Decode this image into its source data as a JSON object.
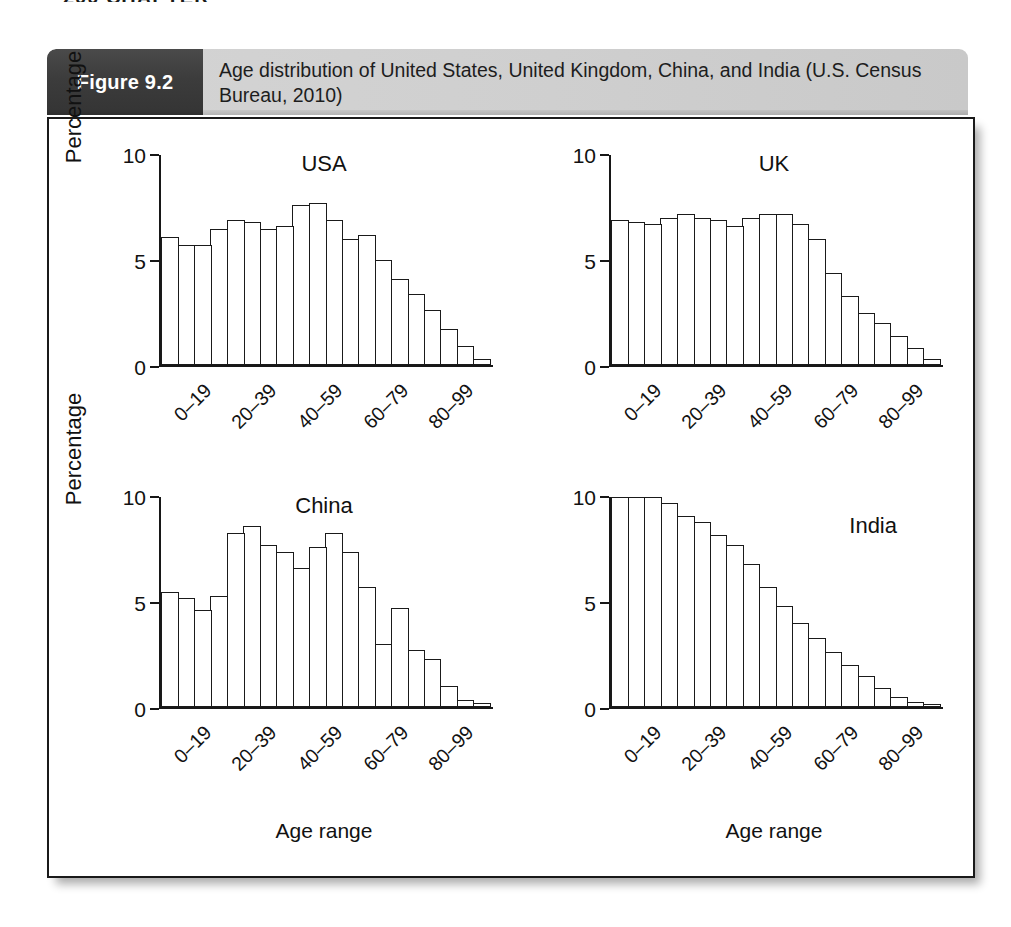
{
  "page": {
    "header_remnant": "200  CHAPTER"
  },
  "figure": {
    "number_label": "Figure 9.2",
    "caption": "Age distribution of United States, United Kingdom, China, and India (U.S. Census Bureau, 2010)"
  },
  "axes": {
    "ylabel": "Percentage",
    "xlabel": "Age range",
    "y_ticks": [
      "0",
      "5",
      "10"
    ],
    "x_tick_labels": [
      "0–19",
      "20–39",
      "40–59",
      "60–79",
      "80–99"
    ]
  },
  "colors": {
    "banner_dark": "#3c3c3c",
    "banner_light": "#cfcfcf",
    "ink": "#1a1a1a",
    "panel_background": "#ffffff"
  },
  "chart_data": [
    {
      "type": "bar",
      "title": "USA",
      "xlabel": "Age range",
      "ylabel": "Percentage",
      "ylim": [
        0,
        10
      ],
      "yticks": [
        0,
        5,
        10
      ],
      "grid": false,
      "legend": "none",
      "bin_width_years": 5,
      "categories": [
        "0–4",
        "5–9",
        "10–14",
        "15–19",
        "20–24",
        "25–29",
        "30–34",
        "35–39",
        "40–44",
        "45–49",
        "50–54",
        "55–59",
        "60–64",
        "65–69",
        "70–74",
        "75–79",
        "80–84",
        "85–89",
        "90–94",
        "95–99"
      ],
      "values": [
        6.1,
        5.7,
        5.7,
        6.5,
        6.9,
        6.8,
        6.5,
        6.6,
        7.6,
        7.7,
        6.9,
        6.0,
        6.2,
        5.0,
        4.1,
        3.4,
        2.6,
        1.7,
        0.9,
        0.3
      ]
    },
    {
      "type": "bar",
      "title": "UK",
      "xlabel": "Age range",
      "ylabel": "Percentage",
      "ylim": [
        0,
        10
      ],
      "yticks": [
        0,
        5,
        10
      ],
      "grid": false,
      "legend": "none",
      "bin_width_years": 5,
      "categories": [
        "0–4",
        "5–9",
        "10–14",
        "15–19",
        "20–24",
        "25–29",
        "30–34",
        "35–39",
        "40–44",
        "45–49",
        "50–54",
        "55–59",
        "60–64",
        "65–69",
        "70–74",
        "75–79",
        "80–84",
        "85–89",
        "90–94",
        "95–99"
      ],
      "values": [
        6.9,
        6.8,
        6.7,
        7.0,
        7.2,
        7.0,
        6.9,
        6.6,
        7.0,
        7.2,
        7.2,
        6.7,
        6.0,
        4.4,
        3.3,
        2.5,
        2.0,
        1.4,
        0.8,
        0.3
      ]
    },
    {
      "type": "bar",
      "title": "China",
      "xlabel": "Age range",
      "ylabel": "Percentage",
      "ylim": [
        0,
        10
      ],
      "yticks": [
        0,
        5,
        10
      ],
      "grid": false,
      "legend": "none",
      "bin_width_years": 5,
      "categories": [
        "0–4",
        "5–9",
        "10–14",
        "15–19",
        "20–24",
        "25–29",
        "30–34",
        "35–39",
        "40–44",
        "45–49",
        "50–54",
        "55–59",
        "60–64",
        "65–69",
        "70–74",
        "75–79",
        "80–84",
        "85–89",
        "90–94",
        "95–99"
      ],
      "values": [
        5.5,
        5.2,
        4.6,
        5.3,
        8.3,
        8.6,
        7.7,
        7.4,
        6.6,
        7.6,
        8.3,
        7.4,
        5.7,
        3.0,
        4.7,
        2.7,
        2.3,
        1.0,
        0.35,
        0.2
      ]
    },
    {
      "type": "bar",
      "title": "India",
      "xlabel": "Age range",
      "ylabel": "Percentage",
      "ylim": [
        0,
        10
      ],
      "yticks": [
        0,
        5,
        10
      ],
      "grid": false,
      "legend": "none",
      "bin_width_years": 5,
      "categories": [
        "0–4",
        "5–9",
        "10–14",
        "15–19",
        "20–24",
        "25–29",
        "30–34",
        "35–39",
        "40–44",
        "45–49",
        "50–54",
        "55–59",
        "60–64",
        "65–69",
        "70–74",
        "75–79",
        "80–84",
        "85–89",
        "90–94",
        "95–99"
      ],
      "values": [
        10.0,
        10.0,
        10.0,
        9.7,
        9.1,
        8.8,
        8.2,
        7.7,
        6.8,
        5.7,
        4.8,
        4.0,
        3.3,
        2.6,
        2.0,
        1.5,
        0.9,
        0.5,
        0.25,
        0.15
      ]
    }
  ]
}
